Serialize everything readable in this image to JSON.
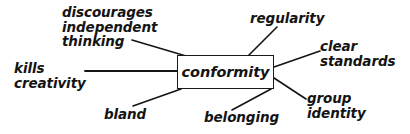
{
  "diagram": {
    "type": "mind-map",
    "title": "conformity",
    "background_color": "#ffffff",
    "ink_color": "#141414",
    "central_node": {
      "label": "conformity",
      "shape": "rectangle",
      "border_color": "#1a1a1a",
      "fill_color": "#ffffff"
    },
    "branches": [
      {
        "id": "discourages-independent-thinking",
        "label": "discourages\nindependent\nthinking",
        "lines": [
          "discourages",
          "independent",
          "thinking"
        ],
        "position": "top-left",
        "label_x": 62,
        "label_y": 5,
        "align": "left",
        "connector": {
          "x1": 132,
          "y1": 40,
          "x2": 186,
          "y2": 56
        }
      },
      {
        "id": "regularity",
        "label": "regularity",
        "lines": [
          "regularity"
        ],
        "position": "top-right",
        "label_x": 250,
        "label_y": 11,
        "align": "left",
        "connector": {
          "x1": 248,
          "y1": 56,
          "x2": 277,
          "y2": 27
        }
      },
      {
        "id": "clear-standards",
        "label": "clear\nstandards",
        "lines": [
          "clear",
          "standards"
        ],
        "position": "right-upper",
        "label_x": 320,
        "label_y": 39,
        "align": "left",
        "connector": {
          "x1": 274,
          "y1": 67,
          "x2": 320,
          "y2": 51
        }
      },
      {
        "id": "group-identity",
        "label": "group\nidentity",
        "lines": [
          "group",
          "identity"
        ],
        "position": "right-lower",
        "label_x": 307,
        "label_y": 91,
        "align": "left",
        "connector": {
          "x1": 274,
          "y1": 78,
          "x2": 306,
          "y2": 99
        }
      },
      {
        "id": "belonging",
        "label": "belonging",
        "lines": [
          "belonging"
        ],
        "position": "bottom-right",
        "label_x": 204,
        "label_y": 110,
        "align": "left",
        "connector": {
          "x1": 271,
          "y1": 89,
          "x2": 232,
          "y2": 110
        }
      },
      {
        "id": "bland",
        "label": "bland",
        "lines": [
          "bland"
        ],
        "position": "bottom-left",
        "label_x": 104,
        "label_y": 107,
        "align": "left",
        "connector": {
          "x1": 181,
          "y1": 89,
          "x2": 133,
          "y2": 106
        }
      },
      {
        "id": "kills-creativity",
        "label": "kills\ncreativity",
        "lines": [
          "kills",
          "creativity"
        ],
        "position": "left",
        "label_x": 14,
        "label_y": 61,
        "align": "left",
        "connector": {
          "x1": 177,
          "y1": 71,
          "x2": 85,
          "y2": 71
        }
      }
    ]
  }
}
